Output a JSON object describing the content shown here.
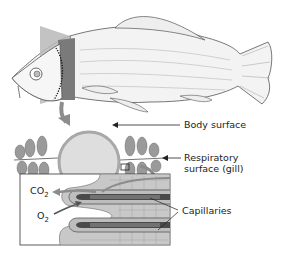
{
  "figure": {
    "labels": {
      "body_surface": "Body surface",
      "respiratory_surface": "Respiratory surface (gill)",
      "respiratory_line1": "Respiratory",
      "respiratory_line2": "surface (gill)",
      "capillaries": "Capillaries",
      "co2": "CO",
      "co2_sub": "2",
      "o2": "O",
      "o2_sub": "2"
    },
    "caption_partial": "",
    "colors": {
      "wedge_light": "#b8b8b8",
      "wedge_dark": "#7a7a7a",
      "circle_fill": "#dedede",
      "circle_stroke": "#a8a8a8",
      "arrow_gray": "#8c8c8c",
      "capillary_dark": "#4a4a4a",
      "tissue": "#c8c8c8"
    }
  }
}
